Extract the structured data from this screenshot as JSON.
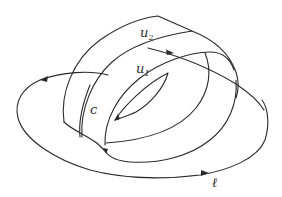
{
  "diagram": {
    "stroke_color": "#2a2a2a",
    "background_color": "#ffffff",
    "labels": {
      "u2": {
        "base": "u",
        "subscript": "2"
      },
      "u1": {
        "base": "u",
        "subscript": "1"
      },
      "c": {
        "text": "c"
      },
      "l": {
        "text": "ℓ"
      }
    },
    "curves": [
      {
        "id": "band-outer-edge",
        "label": "",
        "oriented": false
      },
      {
        "id": "band-stripe-u2",
        "label": "u₂",
        "oriented": false
      },
      {
        "id": "arrow-line",
        "label": "",
        "oriented": true
      },
      {
        "id": "inner-ring-u1",
        "label": "u₁",
        "oriented": false
      },
      {
        "id": "inner-hole-lens",
        "label": "",
        "oriented": true
      },
      {
        "id": "curve-c",
        "label": "c",
        "oriented": false
      },
      {
        "id": "outer-loop-l",
        "label": "ℓ",
        "oriented": true
      }
    ],
    "arrows": [
      {
        "on": "arrow-line",
        "direction": "right"
      },
      {
        "on": "outer-loop-l-top",
        "direction": "left"
      },
      {
        "on": "outer-loop-l-bottom",
        "direction": "right"
      },
      {
        "on": "inner-hole-lens",
        "direction": "down-left"
      },
      {
        "on": "band-lower-junction",
        "direction": "down"
      }
    ]
  }
}
